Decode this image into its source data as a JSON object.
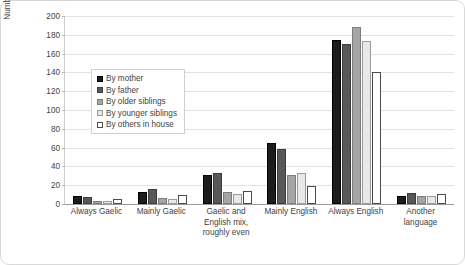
{
  "chart_data": {
    "type": "bar",
    "title": "",
    "subtitle": "",
    "xlabel": "",
    "ylabel": "Number of respondents",
    "ylim": [
      0,
      200
    ],
    "ytick_step": 20,
    "yticks": [
      0,
      20,
      40,
      60,
      80,
      100,
      120,
      140,
      160,
      180,
      200
    ],
    "ytick_labels": [
      "0",
      "20",
      "40",
      "60",
      "80",
      "100",
      "120",
      "140",
      "160",
      "180",
      "200"
    ],
    "grid": true,
    "grid_axis": "y",
    "legend_position": "upper left inside",
    "categories": [
      "Always Gaelic",
      "Mainly Gaelic",
      "Gaelic and English mix, roughly even",
      "Mainly English",
      "Always English",
      "Another language"
    ],
    "series": [
      {
        "name": "By mother",
        "color": "#1c1c1c",
        "values": [
          9,
          13,
          31,
          65,
          175,
          9
        ]
      },
      {
        "name": "By father",
        "color": "#585858",
        "values": [
          7,
          16,
          33,
          58,
          170,
          12
        ]
      },
      {
        "name": "By older siblings",
        "color": "#a5a5a5",
        "values": [
          3,
          6,
          13,
          31,
          188,
          9
        ]
      },
      {
        "name": "By younger siblings",
        "color": "#e8e8e8",
        "values": [
          3,
          5,
          11,
          33,
          173,
          8
        ]
      },
      {
        "name": "By others in house",
        "color": "#ffffff",
        "values": [
          5,
          10,
          14,
          19,
          140,
          11
        ]
      }
    ]
  }
}
